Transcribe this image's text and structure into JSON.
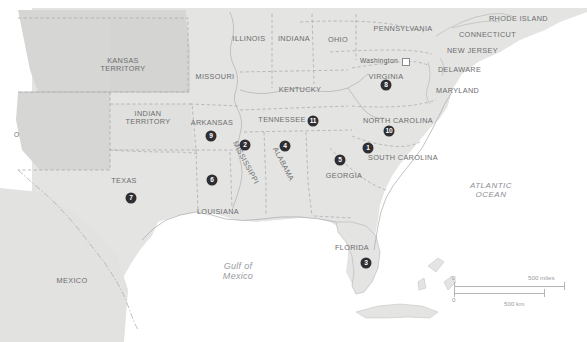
{
  "map": {
    "title": "Map of the United States circa 1860",
    "colors": {
      "land_state": "#e4e4e2",
      "land_territory": "#d2d2d0",
      "water": "#ffffff",
      "border": "#a8a8ac",
      "label_text": "#6d6d70",
      "ocean_text": "#8e8e92",
      "marker_fill": "#2f2f33",
      "marker_text": "#ffffff"
    },
    "labels": [
      {
        "name": "kansas-territory",
        "text": "KANSAS\nTERRITORY",
        "x": 123,
        "y": 62,
        "kind": "territory"
      },
      {
        "name": "indian-territory",
        "text": "INDIAN\nTERRITORY",
        "x": 148,
        "y": 114,
        "kind": "territory"
      },
      {
        "name": "new-mexico-territory-partial",
        "text": "O",
        "x": 18,
        "y": 134,
        "kind": "territory-partial"
      },
      {
        "name": "texas",
        "text": "TEXAS",
        "x": 124,
        "y": 181,
        "kind": "state"
      },
      {
        "name": "mexico",
        "text": "MEXICO",
        "x": 72,
        "y": 281,
        "kind": "country"
      },
      {
        "name": "missouri",
        "text": "MISSOURI",
        "x": 215,
        "y": 77,
        "kind": "state"
      },
      {
        "name": "illinois",
        "text": "ILLINOIS",
        "x": 249,
        "y": 39,
        "kind": "state"
      },
      {
        "name": "indiana",
        "text": "INDIANA",
        "x": 294,
        "y": 39,
        "kind": "state"
      },
      {
        "name": "ohio",
        "text": "OHIO",
        "x": 338,
        "y": 40,
        "kind": "state"
      },
      {
        "name": "kentucky",
        "text": "KENTUCKY",
        "x": 300,
        "y": 90,
        "kind": "state"
      },
      {
        "name": "arkansas",
        "text": "ARKANSAS",
        "x": 212,
        "y": 123,
        "kind": "state"
      },
      {
        "name": "tennessee",
        "text": "TENNESSEE",
        "x": 282,
        "y": 120,
        "kind": "state"
      },
      {
        "name": "mississippi",
        "text": "MISSISSIPPI",
        "x": 243,
        "y": 152,
        "kind": "state-rotated"
      },
      {
        "name": "alabama",
        "text": "ALABAMA",
        "x": 281,
        "y": 158,
        "kind": "state-rotated"
      },
      {
        "name": "louisiana",
        "text": "LOUISIANA",
        "x": 218,
        "y": 212,
        "kind": "state"
      },
      {
        "name": "georgia",
        "text": "GEORGIA",
        "x": 344,
        "y": 176,
        "kind": "state"
      },
      {
        "name": "florida",
        "text": "FLORIDA",
        "x": 352,
        "y": 248,
        "kind": "state"
      },
      {
        "name": "south-carolina",
        "text": "SOUTH CAROLINA",
        "x": 403,
        "y": 158,
        "kind": "state"
      },
      {
        "name": "north-carolina",
        "text": "NORTH CAROLINA",
        "x": 398,
        "y": 121,
        "kind": "state"
      },
      {
        "name": "virginia",
        "text": "VIRGINIA",
        "x": 386,
        "y": 77,
        "kind": "state"
      },
      {
        "name": "pennsylvania",
        "text": "PENNSYLVANIA",
        "x": 403,
        "y": 29,
        "kind": "state"
      },
      {
        "name": "maryland",
        "text": "MARYLAND",
        "x": 462,
        "y": 91,
        "kind": "state"
      },
      {
        "name": "delaware",
        "text": "DELAWARE",
        "x": 469,
        "y": 70,
        "kind": "state"
      },
      {
        "name": "new-jersey",
        "text": "NEW JERSEY",
        "x": 474,
        "y": 51,
        "kind": "state"
      },
      {
        "name": "connecticut",
        "text": "CONNECTICUT",
        "x": 499,
        "y": 35,
        "kind": "state"
      },
      {
        "name": "rhode-island",
        "text": "RHODE ISLAND",
        "x": 500,
        "y": 19,
        "kind": "state"
      },
      {
        "name": "washington-dc",
        "text": "Washington",
        "x": 370,
        "y": 60,
        "kind": "city"
      },
      {
        "name": "atlantic-ocean",
        "text": "ATLANTIC\nOCEAN",
        "x": 491,
        "y": 188,
        "kind": "ocean"
      },
      {
        "name": "gulf-of-mexico",
        "text": "Gulf of\nMexico",
        "x": 238,
        "y": 267,
        "kind": "gulf"
      }
    ],
    "capital_marker": {
      "name": "washington-dc-square",
      "x": 406,
      "y": 62
    },
    "numbered_markers": [
      {
        "n": "1",
        "state": "south-carolina",
        "x": 368,
        "y": 148
      },
      {
        "n": "2",
        "state": "mississippi",
        "x": 245,
        "y": 145
      },
      {
        "n": "3",
        "state": "florida",
        "x": 366,
        "y": 263
      },
      {
        "n": "4",
        "state": "alabama",
        "x": 285,
        "y": 146
      },
      {
        "n": "5",
        "state": "georgia",
        "x": 340,
        "y": 160
      },
      {
        "n": "6",
        "state": "louisiana",
        "x": 212,
        "y": 180
      },
      {
        "n": "7",
        "state": "texas",
        "x": 131,
        "y": 198
      },
      {
        "n": "8",
        "state": "virginia",
        "x": 386,
        "y": 85
      },
      {
        "n": "9",
        "state": "arkansas",
        "x": 211,
        "y": 136
      },
      {
        "n": "10",
        "state": "north-carolina",
        "x": 389,
        "y": 131
      },
      {
        "n": "11",
        "state": "tennessee",
        "x": 313,
        "y": 121
      }
    ],
    "scale": {
      "miles_value": "500 miles",
      "km_value": "500 km",
      "miles_zero": "0",
      "km_zero": "0"
    }
  }
}
